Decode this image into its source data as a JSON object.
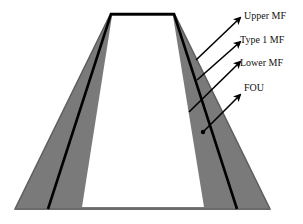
{
  "diagram": {
    "type": "interval type-2 fuzzy membership function (trapezoidal)",
    "labels": {
      "upper_mf": "Upper MF",
      "type1_mf": "Type 1 MF",
      "lower_mf": "Lower MF",
      "fou": "FOU"
    },
    "colors": {
      "fou_fill": "#7a7a7a",
      "fou_edge": "#5e5e5e",
      "type1_line": "#000000",
      "inner": "#ffffff",
      "arrows": "#000000",
      "text": "#111111"
    }
  }
}
